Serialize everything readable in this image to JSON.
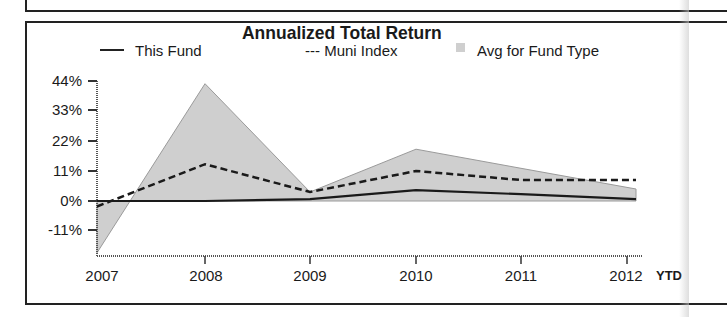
{
  "chart_data": {
    "type": "line",
    "title": "Annualized Total Return",
    "xlabel": "",
    "ylabel": "",
    "categories": [
      "2007",
      "2008",
      "2009",
      "2010",
      "2011",
      "2012"
    ],
    "extra_x_label": "YTD",
    "y_ticks": [
      "44%",
      "33%",
      "22%",
      "11%",
      "0%",
      "-11%"
    ],
    "ylim": [
      -20,
      44
    ],
    "grid": false,
    "legend_position": "top",
    "series": [
      {
        "name": "This Fund",
        "style": "solid",
        "values": [
          0,
          0,
          0.7,
          4,
          2.5,
          0.7
        ]
      },
      {
        "name": "Muni Index",
        "style": "dashed",
        "values": [
          -2,
          13.5,
          3.3,
          11,
          7.7,
          7.7
        ]
      },
      {
        "name": "Avg for Fund Type",
        "style": "area",
        "values": [
          -19,
          43,
          3.3,
          19,
          12,
          4.4
        ]
      }
    ]
  },
  "legend": {
    "this_fund": "This Fund",
    "muni_index": "--- Muni Index",
    "avg_fund_type": "Avg for Fund Type"
  },
  "colors": {
    "area_fill": "#cfcfcf",
    "line": "#1a1a1a"
  }
}
